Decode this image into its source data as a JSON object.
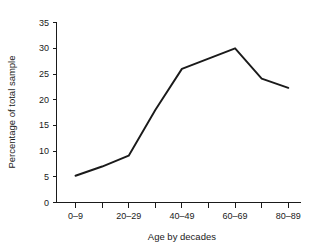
{
  "chart_data": {
    "type": "line",
    "title": "",
    "xlabel": "Age by decades",
    "ylabel": "Percentage of total sample",
    "categories": [
      "0–9",
      "10–19",
      "20–29",
      "30–39",
      "40–49",
      "50–59",
      "60–69",
      "70–79",
      "80–89"
    ],
    "values": [
      5.2,
      7.0,
      9.1,
      18.0,
      26.0,
      28.0,
      30.0,
      24.1,
      22.3
    ],
    "series": [
      {
        "name": "Percentage of total sample",
        "values": [
          5.2,
          7.0,
          9.1,
          18.0,
          26.0,
          28.0,
          30.0,
          24.1,
          22.3
        ]
      }
    ],
    "xtick_labels": [
      "0–9",
      "",
      "20–29",
      "",
      "40–49",
      "",
      "60–69",
      "",
      "80–89"
    ],
    "ytick_labels": [
      "0",
      "5",
      "10",
      "15",
      "20",
      "25",
      "30",
      "35"
    ],
    "ytick_values": [
      0,
      5,
      10,
      15,
      20,
      25,
      30,
      35
    ],
    "ylim": [
      0,
      35
    ],
    "xlim": [
      0,
      8
    ],
    "grid": false,
    "legend": false,
    "legend_position": "none",
    "line_color": "#1a1a1a",
    "background_color": "#ffffff"
  },
  "axes": {
    "y_title": "Percentage of total sample",
    "x_title": "Age by decades"
  }
}
